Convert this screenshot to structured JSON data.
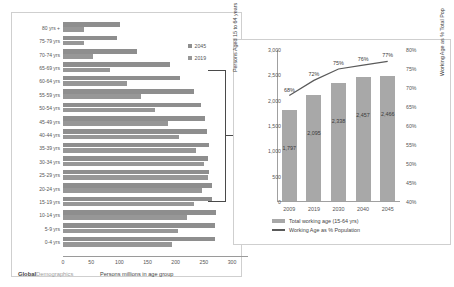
{
  "left_chart": {
    "brand": {
      "bold": "Global",
      "light": "Demographics"
    },
    "xlabel": "Persons millions in age group",
    "xticks": [
      "0",
      "50",
      "100",
      "150",
      "200",
      "250",
      "300"
    ],
    "legend": [
      {
        "label": "2045",
        "color": "#8e8e8e"
      },
      {
        "label": "2019",
        "color": "#979797"
      }
    ]
  },
  "right_chart": {
    "ylabel_left": "Persons Aged 15 to 64 years",
    "ylabel_right": "Working Age as % Total Pop",
    "yticks_left": [
      "3,000",
      "2,500",
      "2,000",
      "1,500",
      "1,000",
      "500",
      "0"
    ],
    "yticks_right": [
      "80%",
      "75%",
      "70%",
      "65%",
      "60%",
      "55%",
      "50%",
      "45%",
      "40%"
    ],
    "legend": [
      {
        "label": "Total working age (15-64 yrs)",
        "type": "bar",
        "color": "#a8a8a8"
      },
      {
        "label": "Working Age as % Population",
        "type": "line",
        "color": "#5a5a5a"
      }
    ]
  },
  "chart_data": [
    {
      "type": "bar",
      "id": "age-pyramid",
      "orientation": "horizontal",
      "title": "",
      "xlabel": "Persons millions in age group",
      "ylabel": "",
      "xlim": [
        0,
        300
      ],
      "xticks": [
        0,
        50,
        100,
        150,
        200,
        250,
        300
      ],
      "grid": false,
      "legend_position": "top-right",
      "categories": [
        "80 yrs +",
        "75-79 yrs",
        "70-74 yrs",
        "65-69 yrs",
        "60-64 yrs",
        "55-59 yrs",
        "50-54 yrs",
        "45-49 yrs",
        "40-44 yrs",
        "35-39 yrs",
        "30-34 yrs",
        "25-29 yrs",
        "20-24 yrs",
        "15-19 yrs",
        "10-14 yrs",
        "5-9 yrs",
        "0-4 yrs"
      ],
      "series": [
        {
          "name": "2045",
          "color": "#8e8e8e",
          "values": [
            101,
            96,
            132,
            190,
            208,
            232,
            245,
            252,
            256,
            260,
            257,
            260,
            264,
            265,
            272,
            269,
            269
          ]
        },
        {
          "name": "2019",
          "color": "#979797",
          "values": [
            38,
            38,
            53,
            84,
            113,
            138,
            163,
            186,
            206,
            236,
            250,
            258,
            247,
            233,
            221,
            205,
            193
          ]
        }
      ],
      "annotation": {
        "type": "bracket",
        "spans_from": "60-64 yrs",
        "spans_to": "15-19 yrs"
      }
    },
    {
      "type": "bar",
      "id": "working-age",
      "title": "",
      "xlabel": "",
      "ylabel": "Persons Aged 15 to 64 years",
      "y2label": "Working Age as % Total Pop",
      "categories": [
        "2009",
        "2019",
        "2030",
        "2040",
        "2045"
      ],
      "ylim": [
        0,
        3000
      ],
      "yticks": [
        0,
        500,
        1000,
        1500,
        2000,
        2500,
        3000
      ],
      "y2lim": [
        40,
        80
      ],
      "y2ticks": [
        40,
        45,
        50,
        55,
        60,
        65,
        70,
        75,
        80
      ],
      "grid": false,
      "legend_position": "bottom",
      "series": [
        {
          "name": "Total working age (15-64 yrs)",
          "type": "bar",
          "color": "#a8a8a8",
          "values": [
            1797,
            2095,
            2338,
            2457,
            2466
          ],
          "labels": [
            "1,797",
            "2,095",
            "2,338",
            "2,457",
            "2,466"
          ]
        },
        {
          "name": "Working Age as % Population",
          "type": "line",
          "axis": "secondary",
          "color": "#5a5a5a",
          "values": [
            68,
            72,
            75,
            76,
            77
          ],
          "labels": [
            "68%",
            "72%",
            "75%",
            "76%",
            "77%"
          ]
        }
      ]
    }
  ]
}
